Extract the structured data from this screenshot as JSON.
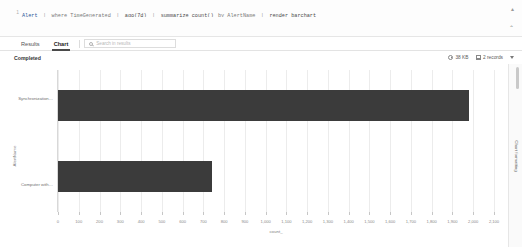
{
  "editor": {
    "line_number": "1",
    "tokens": [
      {
        "t": "Alert",
        "c": "q-tbl"
      },
      {
        "t": "|",
        "c": "q-pipe"
      },
      {
        "t": "where TimeGenerated",
        "c": "q-op"
      },
      {
        "t": "|",
        "c": "q-pipe"
      },
      {
        "t": "ago(7d)",
        "c": "q-fn"
      },
      {
        "t": "|",
        "c": "q-pipe"
      },
      {
        "t": "summarize count()",
        "c": "q-fn"
      },
      {
        "t": "by AlertName",
        "c": "q-op"
      },
      {
        "t": "|",
        "c": "q-pipe"
      },
      {
        "t": "render barchart",
        "c": "q-fn"
      }
    ],
    "collapse_icon": "▴",
    "expand_icon": "⌃"
  },
  "tabs": {
    "items": [
      {
        "label": "Results",
        "active": false
      },
      {
        "label": "Chart",
        "active": true
      }
    ],
    "search": {
      "placeholder": "Search in results",
      "value": "",
      "icon": "search-icon"
    }
  },
  "status": {
    "state": "Completed",
    "size": "38 KB",
    "duration": "2 records",
    "menu_icon": "chevron-down-icon"
  },
  "rail": {
    "label": "Chart formatting"
  },
  "chart_data": {
    "type": "bar",
    "orientation": "horizontal",
    "title": "",
    "xlabel": "count_",
    "ylabel": "AlertName",
    "categories": [
      "Synchronization…",
      "Computer with…"
    ],
    "values": [
      1980,
      740
    ],
    "xlim": [
      0,
      2100
    ],
    "xticks": [
      0,
      100,
      200,
      300,
      400,
      500,
      600,
      700,
      800,
      900,
      1000,
      1100,
      1200,
      1300,
      1400,
      1500,
      1600,
      1700,
      1800,
      1900,
      2000,
      2100
    ],
    "xticklabels": [
      "0",
      "100",
      "200",
      "300",
      "400",
      "500",
      "600",
      "700",
      "800",
      "900",
      "1,000",
      "1,100",
      "1,200",
      "1,300",
      "1,400",
      "1,500",
      "1,600",
      "1,700",
      "1,800",
      "1,900",
      "2,000",
      "2,100"
    ],
    "grid": true,
    "legend": false,
    "bar_color": "#3b3b3b"
  }
}
